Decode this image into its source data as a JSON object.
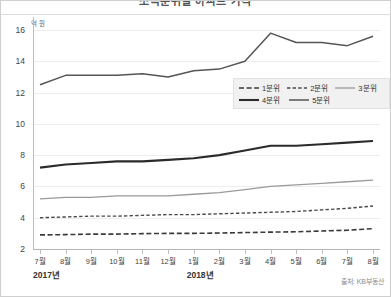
{
  "header": {
    "title": "소득분위별 아파트 가격"
  },
  "axes": {
    "y_unit_label": "억 원",
    "y_ticks": [
      16,
      14,
      12,
      10,
      8,
      6,
      4,
      2
    ],
    "x_labels": [
      "7월",
      "8월",
      "9월",
      "10월",
      "11월",
      "12월",
      "1월",
      "2월",
      "3월",
      "4월",
      "5월",
      "6월",
      "7월",
      "8월"
    ],
    "year_labels": [
      "2017년",
      "2018년"
    ]
  },
  "legend": {
    "rows": [
      [
        {
          "label": "1분위",
          "style": "dashed-long",
          "color": "#3a3a3a",
          "width": 1.6
        },
        {
          "label": "2분위",
          "style": "dashed-short",
          "color": "#4a4a4a",
          "width": 1.4
        },
        {
          "label": "3분위",
          "style": "solid",
          "color": "#9a9a9a",
          "width": 1.3
        }
      ],
      [
        {
          "label": "4분위",
          "style": "solid",
          "color": "#2b2b2b",
          "width": 2.1
        },
        {
          "label": "5분위",
          "style": "solid",
          "color": "#555555",
          "width": 1.5
        }
      ]
    ]
  },
  "footer": {
    "source": "출처: KB부동산"
  },
  "chart_data": {
    "type": "line",
    "title": "소득분위별 아파트 가격",
    "xlabel": "",
    "ylabel": "억 원",
    "ylim": [
      2,
      16
    ],
    "ytick_step": 2,
    "grid": true,
    "legend_position": "inside-right",
    "categories": [
      "2017-07",
      "2017-08",
      "2017-09",
      "2017-10",
      "2017-11",
      "2017-12",
      "2018-01",
      "2018-02",
      "2018-03",
      "2018-04",
      "2018-05",
      "2018-06",
      "2018-07",
      "2018-08"
    ],
    "tick_labels": [
      "7월",
      "8월",
      "9월",
      "10월",
      "11월",
      "12월",
      "1월",
      "2월",
      "3월",
      "4월",
      "5월",
      "6월",
      "7월",
      "8월"
    ],
    "series": [
      {
        "name": "5분위",
        "style": "solid",
        "color": "#555555",
        "width": 1.5,
        "values": [
          12.5,
          13.1,
          13.1,
          13.1,
          13.2,
          13.0,
          13.4,
          13.5,
          14.0,
          15.8,
          15.2,
          15.2,
          15.0,
          15.6
        ]
      },
      {
        "name": "4분위",
        "style": "solid",
        "color": "#2b2b2b",
        "width": 2.1,
        "values": [
          7.2,
          7.4,
          7.5,
          7.6,
          7.6,
          7.7,
          7.8,
          8.0,
          8.3,
          8.6,
          8.6,
          8.7,
          8.8,
          8.9
        ]
      },
      {
        "name": "3분위",
        "style": "solid",
        "color": "#9a9a9a",
        "width": 1.3,
        "values": [
          5.2,
          5.3,
          5.3,
          5.4,
          5.4,
          5.4,
          5.5,
          5.6,
          5.8,
          6.0,
          6.1,
          6.2,
          6.3,
          6.4
        ]
      },
      {
        "name": "2분위",
        "style": "dashed-short",
        "color": "#4a4a4a",
        "width": 1.4,
        "values": [
          4.0,
          4.05,
          4.1,
          4.1,
          4.15,
          4.2,
          4.2,
          4.25,
          4.3,
          4.35,
          4.4,
          4.5,
          4.6,
          4.75
        ]
      },
      {
        "name": "1분위",
        "style": "dashed-long",
        "color": "#3a3a3a",
        "width": 1.6,
        "values": [
          2.9,
          2.92,
          2.95,
          2.95,
          2.98,
          3.0,
          3.0,
          3.02,
          3.05,
          3.08,
          3.1,
          3.15,
          3.2,
          3.3
        ]
      }
    ]
  }
}
